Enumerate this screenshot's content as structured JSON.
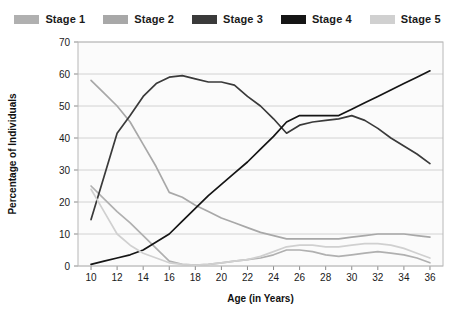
{
  "legend": {
    "position": "top",
    "items": [
      {
        "label": "Stage 1",
        "color": "#b0b0b0"
      },
      {
        "label": "Stage 2",
        "color": "#a8a8a8"
      },
      {
        "label": "Stage 3",
        "color": "#3a3a3a"
      },
      {
        "label": "Stage 4",
        "color": "#151515"
      },
      {
        "label": "Stage 5",
        "color": "#d0d0d0"
      }
    ]
  },
  "chart_data": {
    "type": "line",
    "title": "",
    "subtitle": "",
    "xlabel": "Age (in Years)",
    "ylabel": "Percentage of Individuals",
    "x": [
      10,
      11,
      12,
      13,
      14,
      15,
      16,
      17,
      18,
      19,
      20,
      21,
      22,
      23,
      24,
      25,
      26,
      27,
      28,
      29,
      30,
      31,
      32,
      33,
      34,
      35,
      36
    ],
    "xlim": [
      9,
      37
    ],
    "ylim": [
      0,
      70
    ],
    "xticks": [
      10,
      12,
      14,
      16,
      18,
      20,
      22,
      24,
      26,
      28,
      30,
      32,
      34,
      36
    ],
    "yticks": [
      0,
      10,
      20,
      30,
      40,
      50,
      60,
      70
    ],
    "grid": true,
    "series": [
      {
        "name": "Stage 1",
        "color": "#b0b0b0",
        "values": [
          25,
          21,
          17,
          13.5,
          9.5,
          5.5,
          1.5,
          0.5,
          0.3,
          0.5,
          1,
          1.5,
          2,
          2.5,
          3.5,
          5,
          5,
          4.5,
          3.5,
          3,
          3.5,
          4,
          4.5,
          4,
          3.5,
          2.5,
          1
        ]
      },
      {
        "name": "Stage 2",
        "color": "#a8a8a8",
        "values": [
          58,
          54,
          50,
          45,
          38,
          31,
          23,
          21.5,
          19,
          17,
          15,
          13.5,
          12,
          10.5,
          9.5,
          8.5,
          8.5,
          8.5,
          8.5,
          8.5,
          9,
          9.5,
          10,
          10,
          10,
          9.5,
          9
        ]
      },
      {
        "name": "Stage 3",
        "color": "#3a3a3a",
        "values": [
          14.5,
          28,
          41.5,
          47,
          53,
          57,
          59,
          59.5,
          58.5,
          57.5,
          57.5,
          56.5,
          53,
          50,
          46,
          41.5,
          44,
          45,
          45.5,
          46,
          47,
          45.5,
          43,
          40,
          37.5,
          35,
          32
        ]
      },
      {
        "name": "Stage 4",
        "color": "#151515",
        "values": [
          0.5,
          1.5,
          2.5,
          3.5,
          5,
          7.5,
          10,
          14,
          18,
          22,
          25.5,
          29,
          32.5,
          36.5,
          40.5,
          45,
          47,
          47,
          47,
          47,
          49,
          51,
          53,
          55,
          57,
          59,
          61
        ]
      },
      {
        "name": "Stage 5",
        "color": "#d0d0d0",
        "values": [
          24,
          17,
          10,
          6.5,
          4,
          2.5,
          1,
          0.5,
          0.3,
          0.5,
          1,
          1.5,
          2,
          3,
          4.5,
          6,
          6.5,
          6.5,
          6,
          6,
          6.5,
          7,
          7,
          6.5,
          5.5,
          4,
          2.5
        ]
      }
    ]
  }
}
